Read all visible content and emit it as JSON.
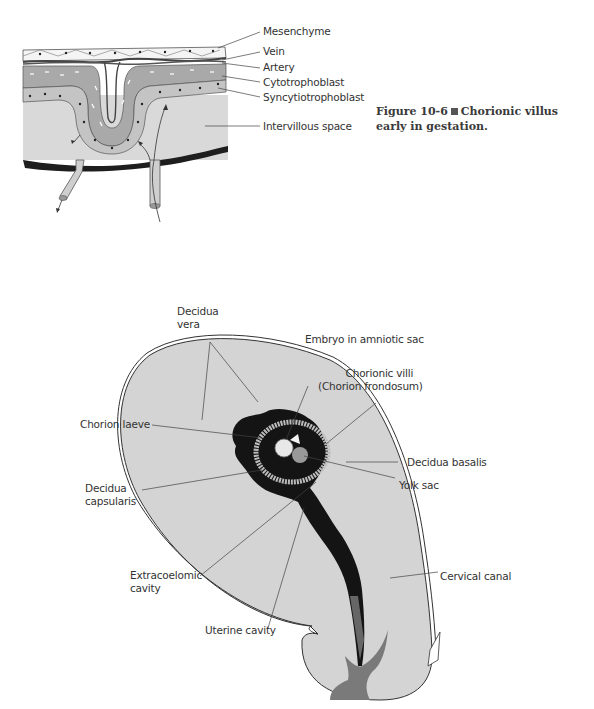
{
  "figure_top": {
    "caption_number": "Figure 10-6",
    "caption_text": "Chorionic villus early in gestation.",
    "labels": {
      "mesenchyme": "Mesenchyme",
      "vein": "Vein",
      "artery": "Artery",
      "cytotrophoblast": "Cytotrophoblast",
      "syncytiotrophoblast": "Syncytiotrophoblast",
      "intervillous_space": "Intervillous space"
    }
  },
  "figure_bottom": {
    "labels": {
      "decidua_vera_1": "Decidua",
      "decidua_vera_2": "vera",
      "embryo": "Embryo in amniotic sac",
      "chorionic_villi_1": "Chorionic villi",
      "chorionic_villi_2": "(Chorion frondosum)",
      "chorion_laeve": "Chorion laeve",
      "decidua_basalis": "Decidua basalis",
      "yolk_sac": "Yolk sac",
      "decidua_capsularis_1": "Decidua",
      "decidua_capsularis_2": "capsularis",
      "extracoelomic_1": "Extracoelomic",
      "extracoelomic_2": "cavity",
      "cervical_canal": "Cervical canal",
      "uterine_cavity": "Uterine cavity"
    }
  },
  "colors": {
    "tissue_light": "#d6d6d6",
    "tissue_mid": "#b4b4b4",
    "cell_layer": "#a8a8a8",
    "dark_band": "#1e1e1e",
    "cavity_black": "#141414",
    "cervix_gray": "#7a7a7a",
    "line": "#444444"
  }
}
